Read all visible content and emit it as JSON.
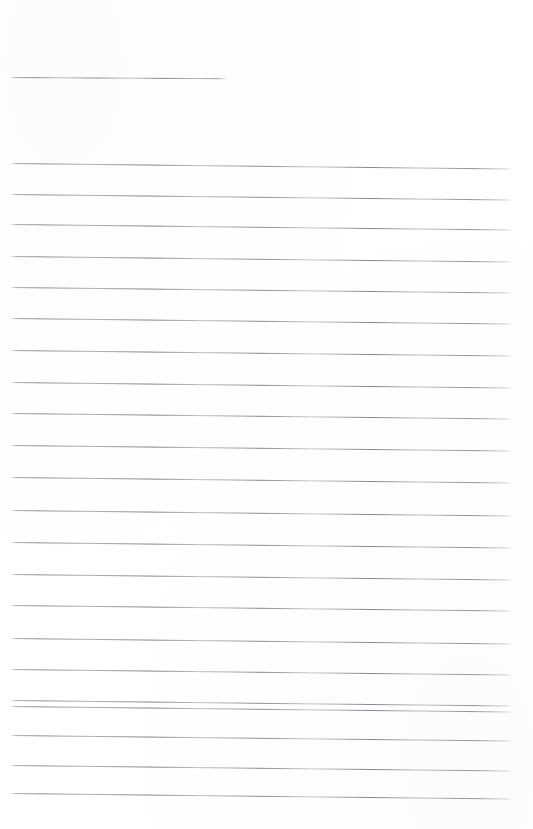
{
  "document": {
    "kind": "scanned-ruled-paper",
    "title": "",
    "page_width": 533,
    "page_height": 829,
    "background_color": "#ffffff",
    "rule_color": "#9a9ea3",
    "rule_thickness_px": 1,
    "scan_skew_degrees": 0.62,
    "visible_text": "",
    "notes": "Blank ruled writing sheet; no glyphs, labels, or values are rendered in the image."
  },
  "header_rule": {
    "name": "header-rule",
    "x": 10,
    "y": 77,
    "width": 218,
    "skew_deg": 0.35
  },
  "body_rules": [
    {
      "index": 1,
      "x": 10,
      "y": 163,
      "width": 502,
      "skew_deg": 0.62
    },
    {
      "index": 2,
      "x": 10,
      "y": 194,
      "width": 502,
      "skew_deg": 0.62
    },
    {
      "index": 3,
      "x": 10,
      "y": 224,
      "width": 502,
      "skew_deg": 0.62
    },
    {
      "index": 4,
      "x": 10,
      "y": 256,
      "width": 502,
      "skew_deg": 0.62
    },
    {
      "index": 5,
      "x": 10,
      "y": 287,
      "width": 502,
      "skew_deg": 0.62
    },
    {
      "index": 6,
      "x": 10,
      "y": 318,
      "width": 502,
      "skew_deg": 0.62
    },
    {
      "index": 7,
      "x": 10,
      "y": 350,
      "width": 502,
      "skew_deg": 0.62
    },
    {
      "index": 8,
      "x": 10,
      "y": 382,
      "width": 502,
      "skew_deg": 0.62
    },
    {
      "index": 9,
      "x": 10,
      "y": 413,
      "width": 502,
      "skew_deg": 0.62
    },
    {
      "index": 10,
      "x": 10,
      "y": 445,
      "width": 502,
      "skew_deg": 0.62
    },
    {
      "index": 11,
      "x": 10,
      "y": 477,
      "width": 502,
      "skew_deg": 0.62
    },
    {
      "index": 12,
      "x": 10,
      "y": 510,
      "width": 502,
      "skew_deg": 0.62
    },
    {
      "index": 13,
      "x": 10,
      "y": 542,
      "width": 502,
      "skew_deg": 0.62
    },
    {
      "index": 14,
      "x": 10,
      "y": 574,
      "width": 502,
      "skew_deg": 0.62
    },
    {
      "index": 15,
      "x": 10,
      "y": 605,
      "width": 502,
      "skew_deg": 0.62
    },
    {
      "index": 16,
      "x": 10,
      "y": 638,
      "width": 502,
      "skew_deg": 0.62
    },
    {
      "index": 17,
      "x": 10,
      "y": 669,
      "width": 502,
      "skew_deg": 0.62
    },
    {
      "index": 18,
      "x": 10,
      "y": 700,
      "width": 502,
      "skew_deg": 0.62
    },
    {
      "index": 19,
      "x": 10,
      "y": 706,
      "width": 502,
      "skew_deg": 0.62
    },
    {
      "index": 20,
      "x": 10,
      "y": 735,
      "width": 502,
      "skew_deg": 0.62
    },
    {
      "index": 21,
      "x": 10,
      "y": 765,
      "width": 502,
      "skew_deg": 0.62
    },
    {
      "index": 22,
      "x": 10,
      "y": 793,
      "width": 502,
      "skew_deg": 0.62
    }
  ]
}
